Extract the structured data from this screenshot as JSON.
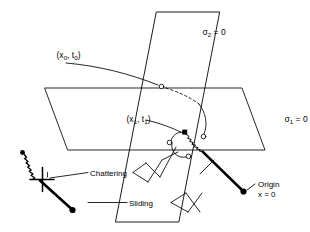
{
  "figure": {
    "background_color": "#ffffff",
    "line_color": "#000000",
    "width": 310,
    "height": 232
  },
  "planes": {
    "sigma2": {
      "label_prefix": "σ",
      "label_sub": "2",
      "label_suffix": " = 0",
      "label_full": "σ₂ = 0",
      "orientation": "vertical"
    },
    "sigma1": {
      "label_prefix": "σ",
      "label_sub": "1",
      "label_suffix": " = 0",
      "label_full": "σ₁ = 0",
      "orientation": "horizontal"
    }
  },
  "points": {
    "initial": {
      "open_paren": "(x",
      "sub0a": "0",
      "comma": ", t",
      "sub0b": "0",
      "close_paren": ")",
      "label_full": "(x₀, t₀)"
    },
    "switch": {
      "open_paren": "(x",
      "sub1a": "1",
      "comma": ", t",
      "sub1b": "1",
      "close_paren": ")",
      "label_full": "(x₁, t₁)"
    },
    "origin": {
      "line1": "Origin",
      "line2": "x = 0"
    }
  },
  "annotations": {
    "chattering": "Chattering",
    "sliding": "Sliding"
  }
}
